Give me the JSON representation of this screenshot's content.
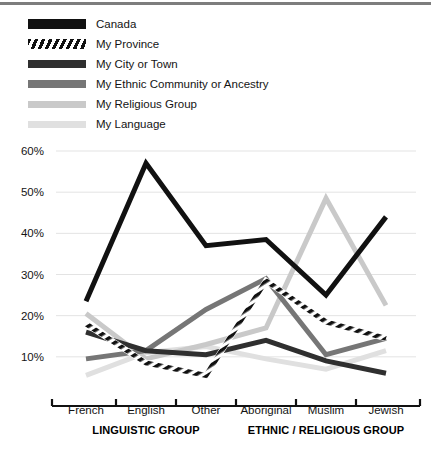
{
  "chart_data": {
    "type": "line",
    "title": "",
    "xlabel": "",
    "ylabel": "",
    "ylim": [
      0,
      60
    ],
    "ytick_values": [
      10,
      20,
      30,
      40,
      50,
      60
    ],
    "ytick_labels": [
      "10%",
      "20%",
      "30%",
      "40%",
      "50%",
      "60%"
    ],
    "grid": true,
    "legend_position": "top-left",
    "categories": [
      "French",
      "English",
      "Other",
      "Aboriginal",
      "Muslim",
      "Jewish"
    ],
    "category_groups": [
      {
        "label": "LINGUISTIC GROUP",
        "categories": [
          "French",
          "English",
          "Other"
        ]
      },
      {
        "label": "ETHNIC / RELIGIOUS GROUP",
        "categories": [
          "Aboriginal",
          "Muslim",
          "Jewish"
        ]
      }
    ],
    "series": [
      {
        "name": "Canada",
        "color": "#111111",
        "style": "solid",
        "width": 5,
        "values": [
          23.5,
          57.0,
          37.0,
          38.5,
          25.0,
          44.0
        ]
      },
      {
        "name": "My Province",
        "color": "#111111",
        "style": "hatched",
        "width": 5,
        "values": [
          18.0,
          8.5,
          5.5,
          28.5,
          18.5,
          14.5
        ]
      },
      {
        "name": "My City or Town",
        "color": "#2f2f2f",
        "style": "solid",
        "width": 5,
        "values": [
          16.0,
          11.5,
          10.5,
          14.0,
          9.0,
          6.0
        ]
      },
      {
        "name": "My Ethnic Community or Ancestry",
        "color": "#767676",
        "style": "solid",
        "width": 5,
        "values": [
          9.5,
          11.5,
          21.5,
          29.0,
          10.5,
          14.5
        ]
      },
      {
        "name": "My Religious Group",
        "color": "#c9c9c9",
        "style": "solid",
        "width": 5,
        "values": [
          20.5,
          9.5,
          13.0,
          17.0,
          48.5,
          22.5
        ]
      },
      {
        "name": "My Language",
        "color": "#e0e0e0",
        "style": "solid",
        "width": 5,
        "values": [
          5.5,
          11.0,
          12.5,
          9.5,
          7.0,
          11.5
        ]
      }
    ]
  },
  "legend": {
    "items": [
      {
        "label": "Canada",
        "swatch": "sw-canada"
      },
      {
        "label": "My Province",
        "swatch": "sw-province"
      },
      {
        "label": "My City or Town",
        "swatch": "sw-city"
      },
      {
        "label": "My Ethnic Community or Ancestry",
        "swatch": "sw-ethnic"
      },
      {
        "label": "My Religious Group",
        "swatch": "sw-religious"
      },
      {
        "label": "My Language",
        "swatch": "sw-language"
      }
    ]
  }
}
